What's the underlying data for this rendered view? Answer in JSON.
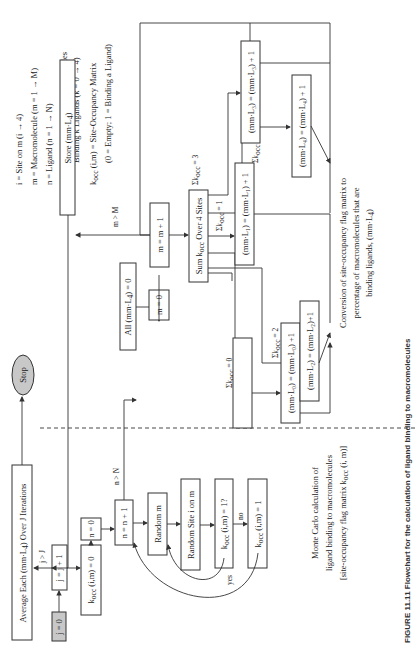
{
  "legend": {
    "lines": [
      "i = Site on m (i → 4)",
      "m = Macromolecule (m = 1 → M)",
      "n = Ligand (n = 1 → N)",
      "(mm·L",
      "Binding k Ligands (k = 0 → 4)",
      "k",
      "(0 = Empty; 1 = Binding a Ligand)"
    ],
    "mmlk_rest": ") = Percent of Macromolecules",
    "kocc_rest": " (i,m) = Site-Occupancy Matrix"
  },
  "boxes": {
    "average": "Average Each (mm·L",
    "average_rest": ") Over J Iterations",
    "stop": "Stop",
    "j0": "j = 0",
    "jj1": "j = j + 1",
    "kocc0": "(i,m) = 0",
    "n0": "n = 0",
    "nn1": "n = n + 1",
    "random_m": "Random m",
    "random_site": "Random Site i on m",
    "kocc_q": "(i,m) = 1?",
    "kocc1": "(i,m) = 1",
    "store": "Store (mm·L",
    "store_rest": ")",
    "all0": "All (mm·L",
    "all0_rest": ") = 0",
    "m0": "m = 0",
    "mm1": "m = m + 1",
    "sum": "Sum k",
    "sum_rest": " Over 4 Sites",
    "l0": "(mm·L₀) = (mm·L₀) +1",
    "l1": "(mm·L₁) = (mm·L₁) + 1",
    "l2": "(mm·L₂) = (mm·L₂)+1",
    "l3": "(mm·L₃) = (mm·L₃) + 1",
    "l4": "(mm·L₄) = (mm·L₄) + 1"
  },
  "labels": {
    "j_gt_J": "j > J",
    "n_gt_N": "n > N",
    "m_gt_M": "m > M",
    "yes": "yes",
    "no": "no",
    "sum0": "Σk",
    "sum0_rest": " = 0",
    "sum1_rest": " = 1",
    "sum2_rest": " = 2",
    "sum3_rest": " = 3",
    "sum4_rest": " = 4",
    "occ": "occ",
    "k4": "4"
  },
  "annotations": {
    "conversion": [
      "Conversion of site-occupancy flag matrix to",
      "percentage of macromolecules that are",
      "binding ligands, (mm·L"
    ],
    "conversion_rest": ")",
    "monte_carlo": [
      "Monte Carlo calculation of",
      "ligand binding to macromolecules",
      "[site-occupancy flag matrix k"
    ],
    "monte_carlo_rest": " (i, m)]"
  },
  "caption": "FIGURE 11.11  Flowchart for the calculation of ligand binding to macromolecules"
}
